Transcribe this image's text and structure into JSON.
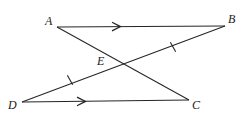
{
  "figure": {
    "background_color": "#ffffff",
    "stroke_color": "#262626",
    "label_color": "#1a1a1a",
    "width": 250,
    "height": 126,
    "points": [
      {
        "name": "A",
        "label": "A",
        "x": 57,
        "y": 27,
        "label_x": 45,
        "label_y": 15
      },
      {
        "name": "B",
        "label": "B",
        "x": 225,
        "y": 26,
        "label_x": 228,
        "label_y": 13
      },
      {
        "name": "C",
        "label": "C",
        "x": 189,
        "y": 100,
        "label_x": 192,
        "label_y": 99
      },
      {
        "name": "D",
        "label": "D",
        "x": 22,
        "y": 102,
        "label_x": 8,
        "label_y": 99
      },
      {
        "name": "E",
        "label": "E",
        "x": 121,
        "y": 66,
        "label_x": 97,
        "label_y": 55
      }
    ],
    "segments": [
      {
        "name": "AB",
        "from": "A",
        "to": "B",
        "x1": 57,
        "y1": 27,
        "x2": 225,
        "y2": 26,
        "marks": "single-arrow"
      },
      {
        "name": "DC",
        "from": "D",
        "to": "C",
        "x1": 22,
        "y1": 102,
        "x2": 189,
        "y2": 100,
        "marks": "single-arrow"
      },
      {
        "name": "AC",
        "from": "A",
        "to": "C",
        "x1": 57,
        "y1": 27,
        "x2": 189,
        "y2": 100,
        "marks": "none"
      },
      {
        "name": "DB",
        "from": "D",
        "to": "B",
        "x1": 22,
        "y1": 102,
        "x2": 225,
        "y2": 26,
        "marks": "tick-DE-and-EB"
      }
    ],
    "arrowheads": [
      {
        "name": "arrow-on-AB",
        "on_segment": "AB",
        "x": 118,
        "y": 26.5,
        "angle": -0.34
      },
      {
        "name": "arrow-on-DC",
        "on_segment": "DC",
        "x": 83,
        "y": 101.3,
        "angle": -0.69
      }
    ],
    "ticks": [
      {
        "name": "tick-on-EB",
        "on_segment": "DB",
        "x": 173,
        "y": 47,
        "angle": -20.5
      },
      {
        "name": "tick-on-DE",
        "on_segment": "DB",
        "x": 70,
        "y": 80,
        "angle": -20.5
      }
    ],
    "notes": {
      "parallel_pair": "AB is parallel to DC (single arrow marks)",
      "congruent_pair": "DE is congruent to EB (single tick marks)"
    }
  }
}
